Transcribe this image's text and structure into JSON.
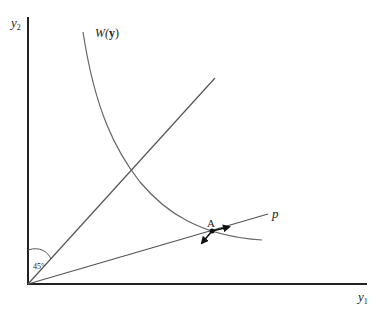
{
  "axes": {
    "y_label": "y",
    "y_sub": "2",
    "x_label": "y",
    "x_sub": "1"
  },
  "curve_label": {
    "prefix": "W(",
    "bold": "y",
    "suffix": ")"
  },
  "line_label": "p",
  "point_label": "A",
  "angle_label": "45°",
  "colors": {
    "axis": "#222222",
    "line": "#555555",
    "curve": "#666666"
  }
}
